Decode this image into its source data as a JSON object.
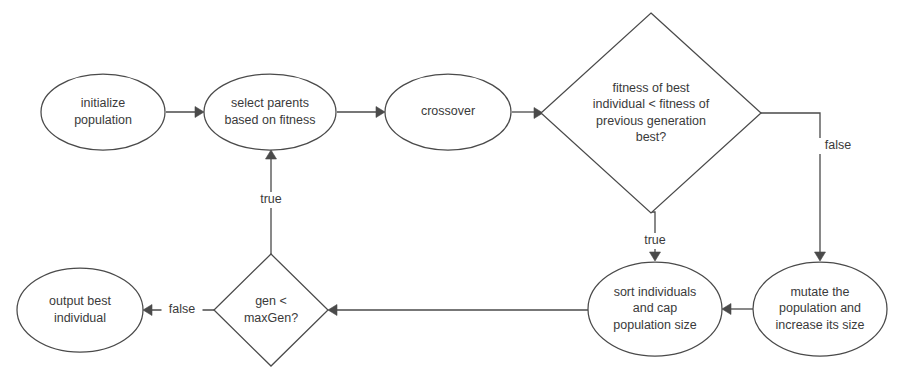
{
  "diagram": {
    "type": "flowchart",
    "background_color": "#ffffff",
    "stroke_color": "#4a4a4a",
    "text_color": "#3a3a3a",
    "nodes": [
      {
        "id": "initialize",
        "shape": "ellipse",
        "name": "initialize-population-node",
        "lines": [
          "initialize",
          "population"
        ],
        "cx": 103,
        "cy": 112,
        "rx": 62,
        "ry": 38
      },
      {
        "id": "select_parents",
        "shape": "ellipse",
        "name": "select-parents-node",
        "lines": [
          "select parents",
          "based on fitness"
        ],
        "cx": 270,
        "cy": 112,
        "rx": 66,
        "ry": 38
      },
      {
        "id": "crossover",
        "shape": "ellipse",
        "name": "crossover-node",
        "lines": [
          "crossover"
        ],
        "cx": 448,
        "cy": 112,
        "rx": 63,
        "ry": 38
      },
      {
        "id": "fitness_check",
        "shape": "diamond",
        "name": "fitness-comparison-decision",
        "lines": [
          "fitness of best",
          "individual < fitness of",
          "previous generation",
          "best?"
        ],
        "cx": 651,
        "cy": 113,
        "rx": 110,
        "ry": 100
      },
      {
        "id": "mutate",
        "shape": "ellipse",
        "name": "mutate-population-node",
        "lines": [
          "mutate the",
          "population and",
          "increase its size"
        ],
        "cx": 820,
        "cy": 309,
        "rx": 67,
        "ry": 47
      },
      {
        "id": "sort_cap",
        "shape": "ellipse",
        "name": "sort-and-cap-node",
        "lines": [
          "sort individuals",
          "and cap",
          "population size"
        ],
        "cx": 655,
        "cy": 309,
        "rx": 67,
        "ry": 47
      },
      {
        "id": "gen_check",
        "shape": "diamond",
        "name": "generation-limit-decision",
        "lines": [
          "gen <",
          "maxGen?"
        ],
        "cx": 271,
        "cy": 310,
        "rx": 57,
        "ry": 56
      },
      {
        "id": "output_best",
        "shape": "ellipse",
        "name": "output-best-individual-node",
        "lines": [
          "output best",
          "individual"
        ],
        "cx": 80,
        "cy": 310,
        "rx": 63,
        "ry": 42
      }
    ],
    "edges": [
      {
        "id": "e1",
        "name": "edge-initialize-to-select",
        "from": "initialize",
        "to": "select_parents",
        "label": "",
        "path": "M 166 112 L 200 112",
        "arrow_at": {
          "x": 204,
          "y": 112,
          "dir": "right"
        }
      },
      {
        "id": "e2",
        "name": "edge-select-to-crossover",
        "from": "select_parents",
        "to": "crossover",
        "label": "",
        "path": "M 337 112 L 381 112",
        "arrow_at": {
          "x": 385,
          "y": 112,
          "dir": "right"
        }
      },
      {
        "id": "e3",
        "name": "edge-crossover-to-fitness",
        "from": "crossover",
        "to": "fitness_check",
        "label": "",
        "path": "M 512 112 L 538 112",
        "arrow_at": {
          "x": 543,
          "y": 113,
          "dir": "right"
        }
      },
      {
        "id": "e4",
        "name": "edge-fitness-false-to-mutate",
        "from": "fitness_check",
        "to": "mutate",
        "label": "false",
        "label_x": 838,
        "label_y": 146,
        "path": "M 761 113 L 820 113 L 820 257",
        "arrow_at": {
          "x": 820,
          "y": 261,
          "dir": "down"
        }
      },
      {
        "id": "e5",
        "name": "edge-fitness-true-to-sort",
        "from": "fitness_check",
        "to": "sort_cap",
        "label": "true",
        "label_x": 655,
        "label_y": 241,
        "path": "M 651 212 L 655 212 L 655 257",
        "arrow_at": {
          "x": 655,
          "y": 261,
          "dir": "down"
        }
      },
      {
        "id": "e6",
        "name": "edge-mutate-to-sort",
        "from": "mutate",
        "to": "sort_cap",
        "label": "",
        "path": "M 753 309 L 727 309",
        "arrow_at": {
          "x": 722,
          "y": 309,
          "dir": "left"
        }
      },
      {
        "id": "e7",
        "name": "edge-sort-to-gen-check",
        "from": "sort_cap",
        "to": "gen_check",
        "label": "",
        "path": "M 588 310 L 333 310",
        "arrow_at": {
          "x": 328,
          "y": 310,
          "dir": "left"
        }
      },
      {
        "id": "e8",
        "name": "edge-gen-true-to-select",
        "from": "gen_check",
        "to": "select_parents",
        "label": "true",
        "label_x": 271,
        "label_y": 200,
        "path": "M 271 254 L 271 155",
        "arrow_at": {
          "x": 271,
          "y": 150,
          "dir": "up"
        }
      },
      {
        "id": "e9",
        "name": "edge-gen-false-to-output",
        "from": "gen_check",
        "to": "output_best",
        "label": "false",
        "label_x": 182,
        "label_y": 310,
        "path": "M 214 310 L 148 310",
        "arrow_at": {
          "x": 143,
          "y": 310,
          "dir": "left"
        }
      }
    ]
  }
}
